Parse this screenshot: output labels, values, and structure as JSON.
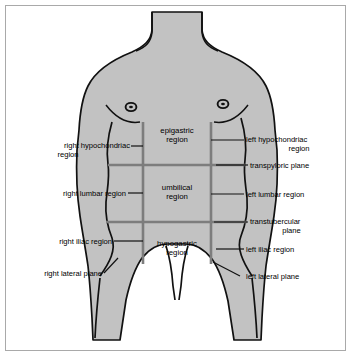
{
  "figure": {
    "colors": {
      "body_fill": "#c2c2c2",
      "outline": "#000000",
      "grid_line": "#7d7d7d",
      "frame_border": "#a9a9a9",
      "background": "#ffffff",
      "text": "#000000"
    }
  },
  "regions": [
    {
      "id": "epigastric",
      "label": "epigastric\nregion",
      "line1": "epigastric",
      "line2": "region"
    },
    {
      "id": "umbilical",
      "label": "umbilical\nregion",
      "line1": "umbilical",
      "line2": "region"
    },
    {
      "id": "hypogastric",
      "label": "hypogastric\nregion",
      "line1": "hypogastric",
      "line2": "region"
    }
  ],
  "left_labels": [
    {
      "id": "right-hypochondriac-region",
      "line1": "right hypochondriac",
      "line2": "region"
    },
    {
      "id": "right-lumbar-region",
      "line1": "right lumbar region",
      "line2": ""
    },
    {
      "id": "right-iliac-region",
      "line1": "right iliac region",
      "line2": ""
    },
    {
      "id": "right-lateral-plane",
      "line1": "right lateral plane",
      "line2": ""
    }
  ],
  "right_labels": [
    {
      "id": "left-hypochondriac-region",
      "line1": "left hypochondriac",
      "line2": "region"
    },
    {
      "id": "transpyloric-plane",
      "line1": "transpyloric plane",
      "line2": ""
    },
    {
      "id": "left-lumbar-region",
      "line1": "left lumbar region",
      "line2": ""
    },
    {
      "id": "transtubercular-plane",
      "line1": "transtubercular",
      "line2": "plane"
    },
    {
      "id": "left-iliac-region",
      "line1": "left iliac region",
      "line2": ""
    },
    {
      "id": "left-lateral-plane",
      "line1": "left lateral plane",
      "line2": ""
    }
  ]
}
